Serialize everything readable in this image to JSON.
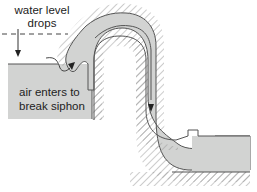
{
  "diagram": {
    "labels": {
      "water_level_line1": "water level",
      "water_level_line2": "drops",
      "air_line1": "air enters to",
      "air_line2": "break siphon"
    },
    "colors": {
      "water": "#d2d3d2",
      "outline": "#555555",
      "hatch": "#9a9a9a",
      "text": "#222222",
      "background": "#ffffff"
    },
    "icons": {
      "water_level_arrow": "down-arrow",
      "air_arrow": "curved-arrow",
      "flow_arrow": "down-arrow"
    }
  }
}
